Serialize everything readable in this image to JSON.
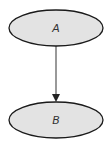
{
  "diagram": {
    "type": "flow",
    "nodes": [
      {
        "id": "A",
        "label": "A",
        "shape": "ellipse",
        "fill": "#e3e3e3",
        "stroke": "#1a1a1a"
      },
      {
        "id": "B",
        "label": "B",
        "shape": "ellipse",
        "fill": "#e3e3e3",
        "stroke": "#1a1a1a"
      }
    ],
    "edges": [
      {
        "from": "A",
        "to": "B",
        "directed": true,
        "color": "#444444"
      }
    ]
  }
}
